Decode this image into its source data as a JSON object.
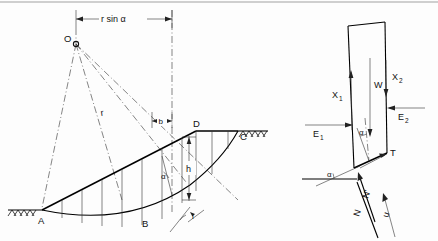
{
  "figure": {
    "left_diagram": {
      "name": "circular-slip-surface",
      "top_dimension": {
        "label": "r sin α"
      },
      "slice_dimension": {
        "label": "b"
      },
      "height_dimension": {
        "label": "h"
      },
      "radius_label": "r",
      "centre_point": "O",
      "points": {
        "A": "A",
        "B": "B",
        "C": "C",
        "D": "D"
      },
      "angles": {
        "slice_base_inclination": "α",
        "slope_base_angle": "i"
      }
    },
    "right_diagram": {
      "name": "slice-free-body",
      "forces": {
        "weight": "W",
        "interslice_shear_left": "X",
        "interslice_shear_left_sub": "1",
        "interslice_shear_right": "X",
        "interslice_shear_right_sub": "2",
        "interslice_normal_left": "E",
        "interslice_normal_left_sub": "1",
        "interslice_normal_right": "E",
        "interslice_normal_right_sub": "2",
        "shear_on_base": "T",
        "effective_normal": "N'",
        "total_normal": "N",
        "pore_water_force": "u"
      },
      "angles": {
        "base_inclination_top": "α",
        "base_inclination_bottom": "α"
      }
    },
    "colors": {
      "ink": "#111111",
      "construction": "#333333",
      "background": "#ffffff"
    }
  }
}
